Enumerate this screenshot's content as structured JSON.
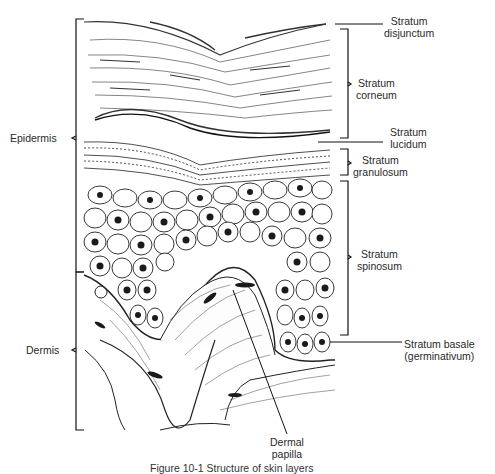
{
  "figure": {
    "caption_partial": "Figure 10-1 Structure of skin layers"
  },
  "labels": {
    "right": [
      {
        "id": "disjunctum",
        "line1": "Stratum",
        "line2": "disjunctum"
      },
      {
        "id": "corneum",
        "line1": "Stratum",
        "line2": "corneum"
      },
      {
        "id": "lucidum",
        "line1": "Stratum",
        "line2": "lucidum"
      },
      {
        "id": "granulosum",
        "line1": "Stratum",
        "line2": "granulosum"
      },
      {
        "id": "spinosum",
        "line1": "Stratum",
        "line2": "spinosum"
      },
      {
        "id": "basale",
        "line1": "Stratum basale",
        "line2": "(germinativum)"
      }
    ],
    "left": [
      {
        "id": "epidermis",
        "text": "Epidermis"
      },
      {
        "id": "dermis",
        "text": "Dermis"
      }
    ],
    "bottom": [
      {
        "id": "dermal-papilla",
        "line1": "Dermal",
        "line2": "papilla"
      }
    ]
  },
  "colors": {
    "ink": "#1a1a1a",
    "background": "#ffffff"
  }
}
